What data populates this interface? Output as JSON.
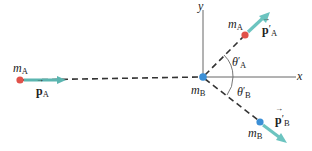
{
  "diagram": {
    "axes": {
      "x_label": "x",
      "y_label": "y"
    },
    "before": {
      "mass_label": "m",
      "mass_sub": "A",
      "momentum_label": "p",
      "momentum_sub": "A"
    },
    "origin": {
      "mass_label": "m",
      "mass_sub": "B"
    },
    "after_A": {
      "mass_label": "m",
      "mass_sub": "A",
      "momentum_label": "p",
      "momentum_prime": "′",
      "momentum_sub": "A",
      "angle_label": "θ",
      "angle_prime": "′",
      "angle_sub": "A"
    },
    "after_B": {
      "mass_label": "m",
      "mass_sub": "B",
      "momentum_label": "p",
      "momentum_prime": "′",
      "momentum_sub": "B",
      "angle_label": "θ",
      "angle_prime": "′",
      "angle_sub": "B"
    },
    "colors": {
      "mass_A": "#e0524a",
      "mass_B": "#3b8fd6",
      "arrow": "#6cc4c0",
      "arrow_dark": "#3a8c88",
      "line": "#333333",
      "axis": "#555555"
    }
  }
}
